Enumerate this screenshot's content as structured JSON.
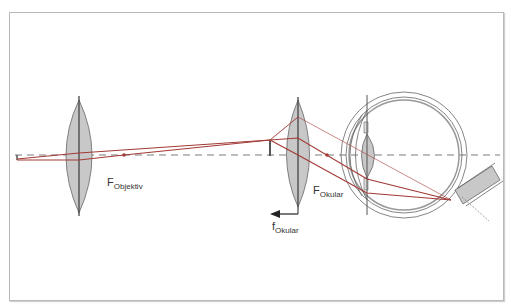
{
  "diagram": {
    "type": "optical ray diagram — microscope with eye",
    "labels": {
      "f_objektiv_main": "F",
      "f_objektiv_sub": "Objektiv",
      "f_okular_main": "F",
      "f_okular_sub": "Okular",
      "focal_length_main": "f",
      "focal_length_sub": "Okular"
    },
    "colors": {
      "ray": "#a23a35",
      "lens_fill": "#c8c8c8",
      "axis": "#7a7a7a",
      "outline": "#555555"
    },
    "elements": [
      "object",
      "objective-lens",
      "objective-focal-point",
      "intermediate-image",
      "eyepiece-lens",
      "eyepiece-focal-point",
      "eye",
      "optic-nerve"
    ]
  }
}
